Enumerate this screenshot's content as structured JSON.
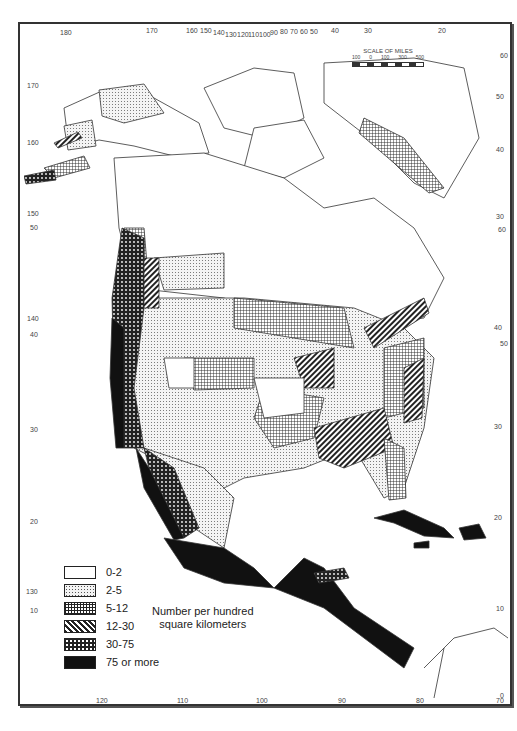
{
  "map": {
    "subject": "Population density map of North America, Central America and the Caribbean",
    "scale": {
      "title": "SCALE OF MILES",
      "ticks": [
        "100",
        "0",
        "100",
        "300",
        "500"
      ]
    },
    "top_longitude_ticks": [
      "180",
      "170",
      "160",
      "150",
      "140",
      "130",
      "120",
      "110",
      "100",
      "90",
      "80",
      "70",
      "60",
      "50",
      "40",
      "30",
      "20"
    ],
    "bottom_longitude_ticks": [
      "120",
      "110",
      "100",
      "90",
      "80",
      "70"
    ],
    "left_latitude_ticks": [
      "170",
      "160",
      "150",
      "50",
      "140",
      "40",
      "30",
      "20",
      "130",
      "10"
    ],
    "right_latitude_ticks": [
      "60",
      "50",
      "40",
      "30",
      "60",
      "40",
      "50",
      "30",
      "20",
      "10",
      "0"
    ],
    "legend": {
      "caption_line1": "Number per hundred",
      "caption_line2": "square kilometers",
      "items": [
        {
          "label": "0-2",
          "pattern": "blank",
          "color": "#ffffff"
        },
        {
          "label": "2-5",
          "pattern": "stippled-dots",
          "color": "#e6e6e6"
        },
        {
          "label": "5-12",
          "pattern": "crosshatch-grid",
          "color": "#9a9a9a"
        },
        {
          "label": "12-30",
          "pattern": "diagonal-stripes",
          "color": "#666666"
        },
        {
          "label": "30-75",
          "pattern": "black-with-white-dots",
          "color": "#333333"
        },
        {
          "label": "75 or more",
          "pattern": "solid-black",
          "color": "#111111"
        }
      ]
    }
  }
}
